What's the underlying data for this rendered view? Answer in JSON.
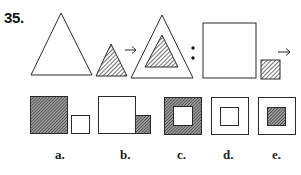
{
  "question": {
    "number": "35.",
    "analogy": {
      "first_pair": {
        "a": "large white triangle",
        "b": "small hatched triangle",
        "result": "large white triangle containing small hatched triangle"
      },
      "separator": ":",
      "second_pair": {
        "a": "large white square",
        "b": "small hatched square",
        "result": "?"
      },
      "arrow_glyph": "→"
    },
    "options": [
      {
        "label": "a.",
        "description": "large hatched square beside small white square"
      },
      {
        "label": "b.",
        "description": "large white square beside small hatched square"
      },
      {
        "label": "c.",
        "description": "hatched square with white inner square"
      },
      {
        "label": "d.",
        "description": "white square with white inner square"
      },
      {
        "label": "e.",
        "description": "white square with hatched inner square"
      }
    ]
  },
  "colors": {
    "stroke": "#2a2a2a",
    "hatch": "#3a3a3a",
    "background": "#ffffff"
  }
}
